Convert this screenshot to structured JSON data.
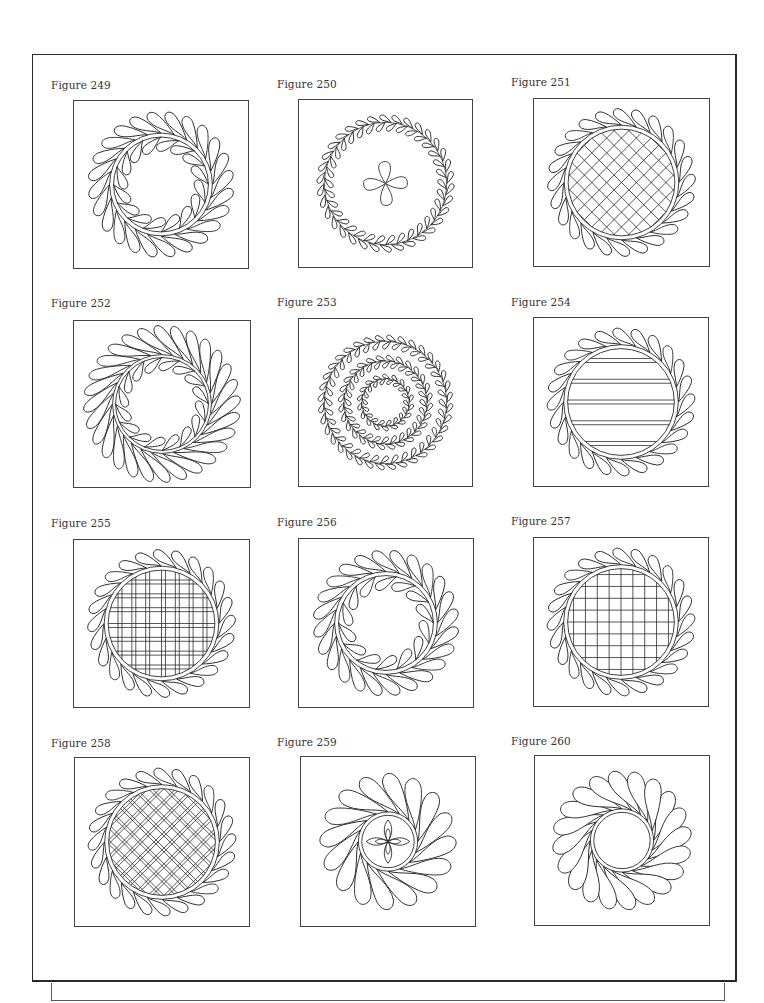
{
  "page": {
    "background": "#ffffff",
    "line_color": "#2a2a2a"
  },
  "figures": [
    {
      "label": "Figure 249",
      "motif": "double-feather-wreath",
      "center": "open",
      "outer_feathers": 24,
      "inner_feathers": 16
    },
    {
      "label": "Figure 250",
      "motif": "double-feather-vine-ring",
      "center": "pinwheel",
      "outer_feathers": 34,
      "inner_feathers": 30
    },
    {
      "label": "Figure 251",
      "motif": "feather-wreath",
      "center": "diagonal-crosshatch",
      "outer_feathers": 24
    },
    {
      "label": "Figure 252",
      "motif": "square-feather-frame-with-inner-wreath",
      "center": "open",
      "outer_feathers": 32,
      "inner_feathers": 16
    },
    {
      "label": "Figure 253",
      "motif": "triple-feather-vine-rings",
      "center": "open",
      "outer_feathers": 36
    },
    {
      "label": "Figure 254",
      "motif": "feather-wreath",
      "center": "horizontal-double-lines",
      "outer_feathers": 24
    },
    {
      "label": "Figure 255",
      "motif": "feather-wreath",
      "center": "plaid-grid",
      "outer_feathers": 24
    },
    {
      "label": "Figure 256",
      "motif": "double-feather-wreath",
      "center": "open",
      "outer_feathers": 24,
      "inner_feathers": 14
    },
    {
      "label": "Figure 257",
      "motif": "feather-wreath",
      "center": "square-grid",
      "outer_feathers": 24
    },
    {
      "label": "Figure 258",
      "motif": "feather-wreath",
      "center": "diagonal-double-crosshatch",
      "outer_feathers": 24
    },
    {
      "label": "Figure 259",
      "motif": "large-feather-wreath",
      "center": "four-petal-flower",
      "outer_feathers": 16
    },
    {
      "label": "Figure 260",
      "motif": "large-feather-wreath",
      "center": "open-circle",
      "outer_feathers": 20
    }
  ]
}
